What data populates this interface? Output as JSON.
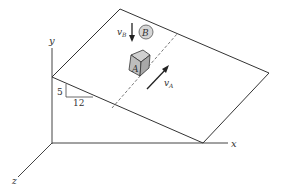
{
  "figure": {
    "axes": {
      "x_label": "x",
      "y_label": "y",
      "z_label": "z"
    },
    "slope": {
      "rise": "5",
      "run": "12"
    },
    "block": {
      "label": "A",
      "velocity_label": "v",
      "velocity_sub": "A"
    },
    "ball": {
      "label": "B",
      "velocity_label": "v",
      "velocity_sub": "B"
    },
    "colors": {
      "line": "#333333",
      "block_fill": "#bdbdbd",
      "ball_fill": "#d6d6d6"
    }
  }
}
